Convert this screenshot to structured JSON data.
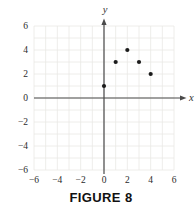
{
  "figure": {
    "caption": "FIGURE 8"
  },
  "chart_data": {
    "type": "scatter",
    "points": [
      [
        0,
        1
      ],
      [
        1,
        3
      ],
      [
        2,
        4
      ],
      [
        3,
        3
      ],
      [
        4,
        2
      ]
    ],
    "title": "",
    "xlabel": "x",
    "ylabel": "y",
    "xlim": [
      -6,
      6
    ],
    "ylim": [
      -6,
      6
    ],
    "grid": true,
    "grid_step": 1,
    "tick_values": [
      -6,
      -4,
      -2,
      0,
      2,
      4,
      6
    ],
    "tick_labels": [
      "−6",
      "−4",
      "−2",
      "0",
      "2",
      "4",
      "6"
    ],
    "legend": "none",
    "colors": {
      "background": "#ffffff",
      "grid": "#eae8e4",
      "axis": "#4a4a4a",
      "point": "#1b1b1b",
      "tick_label": "#2a2a2a",
      "axis_label": "#333333"
    }
  }
}
